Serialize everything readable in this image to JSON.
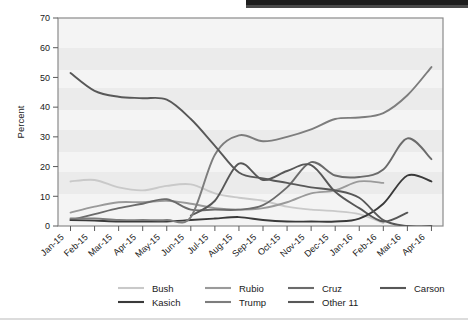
{
  "chart_data": {
    "type": "line",
    "title": "",
    "xlabel": "",
    "ylabel": "Percent",
    "ylim": [
      0,
      70
    ],
    "yticks": [
      0,
      10,
      20,
      30,
      40,
      50,
      60,
      70
    ],
    "grid": false,
    "banded_background": true,
    "legend_position": "bottom",
    "x": [
      "Jan-15",
      "Feb-15",
      "Mar-15",
      "Apr-15",
      "May-15",
      "Jun-15",
      "Jul-15",
      "Aug-15",
      "Sep-15",
      "Oct-15",
      "Nov-15",
      "Dec-15",
      "Jan-16",
      "Feb-16",
      "Mar-16",
      "Apr-16"
    ],
    "series": [
      {
        "name": "Bush",
        "color": "#c9c9c9",
        "values": [
          15.0,
          15.5,
          13.0,
          12.0,
          13.5,
          14.0,
          11.0,
          9.5,
          8.5,
          6.5,
          5.5,
          5.0,
          4.0,
          1.0,
          null,
          null
        ]
      },
      {
        "name": "Rubio",
        "color": "#9a9a9a",
        "values": [
          4.5,
          6.5,
          8.0,
          8.0,
          8.5,
          7.5,
          6.0,
          5.5,
          6.0,
          8.0,
          11.0,
          12.0,
          15.0,
          14.5,
          null,
          null
        ]
      },
      {
        "name": "Cruz",
        "color": "#6b6b6b",
        "values": [
          2.0,
          4.0,
          6.0,
          7.5,
          9.0,
          5.5,
          5.5,
          5.5,
          7.0,
          13.0,
          21.5,
          17.0,
          16.5,
          19.0,
          29.5,
          22.5
        ]
      },
      {
        "name": "Carson",
        "color": "#575757",
        "values": [
          null,
          null,
          null,
          null,
          null,
          3.5,
          8.5,
          21.0,
          15.5,
          18.5,
          20.5,
          11.5,
          6.0,
          1.5,
          4.5,
          null
        ]
      },
      {
        "name": "Kasich",
        "color": "#3a3a3a",
        "values": [
          2.0,
          1.8,
          1.5,
          1.5,
          1.5,
          2.0,
          2.5,
          3.0,
          2.0,
          1.5,
          1.5,
          1.5,
          2.5,
          7.5,
          17.0,
          15.0
        ]
      },
      {
        "name": "Trump",
        "color": "#7d7d7d",
        "values": [
          2.5,
          2.5,
          2.0,
          2.0,
          2.0,
          3.0,
          24.0,
          30.5,
          28.5,
          30.0,
          32.5,
          36.0,
          36.5,
          38.0,
          44.0,
          53.5
        ]
      },
      {
        "name": "Other 11",
        "color": "#585858",
        "values": [
          51.5,
          45.5,
          43.5,
          43.0,
          42.5,
          36.0,
          27.0,
          18.0,
          16.0,
          14.5,
          13.0,
          12.0,
          9.5,
          2.0,
          0.0,
          0.0
        ]
      }
    ]
  },
  "axis": {
    "ylabel": "Percent",
    "yticks": [
      "0",
      "10",
      "20",
      "30",
      "40",
      "50",
      "60",
      "70"
    ],
    "xticks": [
      "Jan-15",
      "Feb-15",
      "Mar-15",
      "Apr-15",
      "May-15",
      "Jun-15",
      "Jul-15",
      "Aug-15",
      "Sep-15",
      "Oct-15",
      "Nov-15",
      "Dec-15",
      "Jan-16",
      "Feb-16",
      "Mar-16",
      "Apr-16"
    ]
  },
  "legend": {
    "row1": [
      {
        "label": "Bush",
        "color": "#c9c9c9"
      },
      {
        "label": "Rubio",
        "color": "#9a9a9a"
      },
      {
        "label": "Cruz",
        "color": "#6b6b6b"
      },
      {
        "label": "Carson",
        "color": "#575757"
      }
    ],
    "row2": [
      {
        "label": "Kasich",
        "color": "#3a3a3a"
      },
      {
        "label": "Trump",
        "color": "#7d7d7d"
      },
      {
        "label": "Other 11",
        "color": "#585858"
      }
    ]
  }
}
